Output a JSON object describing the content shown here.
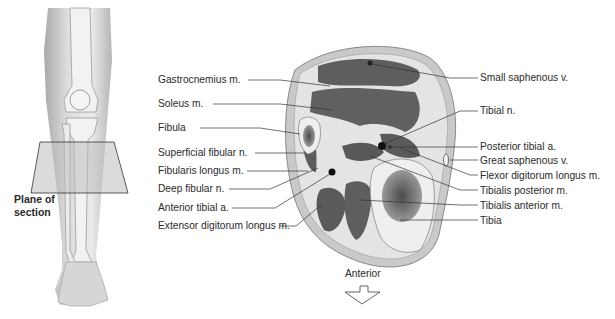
{
  "figure": {
    "left_panel": {
      "description": "anterior view of right leg skeleton with plane of section",
      "plane_label": [
        "Plane of",
        "section"
      ]
    },
    "cross_section": {
      "left_labels": [
        {
          "text": "Gastrocnemius m.",
          "y": 80
        },
        {
          "text": "Soleus m.",
          "y": 104
        },
        {
          "text": "Fibula",
          "y": 128
        },
        {
          "text": "Superficial fibular n.",
          "y": 153
        },
        {
          "text": "Fibularis longus m.",
          "y": 171
        },
        {
          "text": "Deep fibular n.",
          "y": 189
        },
        {
          "text": "Anterior tibial a.",
          "y": 208
        },
        {
          "text": "Extensor digitorum longus m.",
          "y": 226
        }
      ],
      "right_labels": [
        {
          "text": "Small saphenous v.",
          "y": 78
        },
        {
          "text": "Tibial n.",
          "y": 111
        },
        {
          "text": "Posterior tibial a.",
          "y": 146
        },
        {
          "text": "Great saphenous v.",
          "y": 160
        },
        {
          "text": "Flexor digitorum longus m.",
          "y": 175
        },
        {
          "text": "Tibialis posterior m.",
          "y": 190
        },
        {
          "text": "Tibialis anterior m.",
          "y": 205
        },
        {
          "text": "Tibia",
          "y": 220
        }
      ],
      "orientation_label": "Anterior"
    },
    "colors": {
      "muscle": "#5e5e5e",
      "fascia": "#e4e4e4",
      "skin": "#c9c9c9",
      "bone": "#efefef",
      "marrow": "#7a7a7a",
      "plane": "#bdbdbd"
    }
  }
}
